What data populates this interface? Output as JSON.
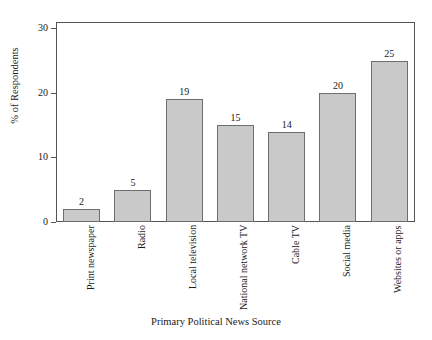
{
  "chart_data": {
    "type": "bar",
    "title": "",
    "xlabel": "Primary Political News Source",
    "ylabel": "% of Respondents",
    "categories": [
      "Print newspaper",
      "Radio",
      "Local television",
      "National network TV",
      "Cable TV",
      "Social media",
      "Websites or apps"
    ],
    "values": [
      2,
      5,
      19,
      15,
      14,
      20,
      25
    ],
    "value_labels": [
      "2",
      "5",
      "19",
      "15",
      "14",
      "20",
      "25"
    ],
    "ylim": [
      0,
      31
    ],
    "yticks": [
      0,
      10,
      20,
      30
    ],
    "ytick_labels": [
      "0",
      "10",
      "20",
      "30"
    ],
    "grid": false,
    "legend": "none",
    "bar_color": "#c9c9c9",
    "bar_border_color": "#6e6e6e",
    "axis_color": "#555555",
    "text_color": "#1a1a1a"
  },
  "figure": {
    "background": "#ffffff",
    "cutoff_title": ""
  }
}
